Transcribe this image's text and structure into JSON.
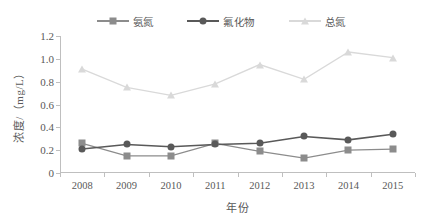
{
  "chart_data": {
    "type": "line",
    "title": "",
    "xlabel": "年份",
    "ylabel": "浓度/（mg/L）",
    "categories": [
      "2008",
      "2009",
      "2010",
      "2011",
      "2012",
      "2013",
      "2014",
      "2015"
    ],
    "ylim": [
      0,
      1.2
    ],
    "yticks": [
      "0",
      "0.2",
      "0.4",
      "0.6",
      "0.8",
      "1.0",
      "1.2"
    ],
    "ytick_values": [
      0,
      0.2,
      0.4,
      0.6,
      0.8,
      1.0,
      1.2
    ],
    "grid": false,
    "legend_position": "top-center",
    "series": [
      {
        "name": "氨氮",
        "color": "#8c8c8c",
        "marker": "square",
        "values": [
          0.26,
          0.15,
          0.15,
          0.26,
          0.19,
          0.13,
          0.2,
          0.21
        ]
      },
      {
        "name": "氟化物",
        "color": "#595959",
        "marker": "circle",
        "values": [
          0.21,
          0.25,
          0.23,
          0.25,
          0.26,
          0.32,
          0.29,
          0.34
        ]
      },
      {
        "name": "总氮",
        "color": "#d9d9d9",
        "marker": "triangle",
        "values": [
          0.91,
          0.75,
          0.68,
          0.78,
          0.95,
          0.82,
          1.06,
          1.01
        ]
      }
    ]
  }
}
